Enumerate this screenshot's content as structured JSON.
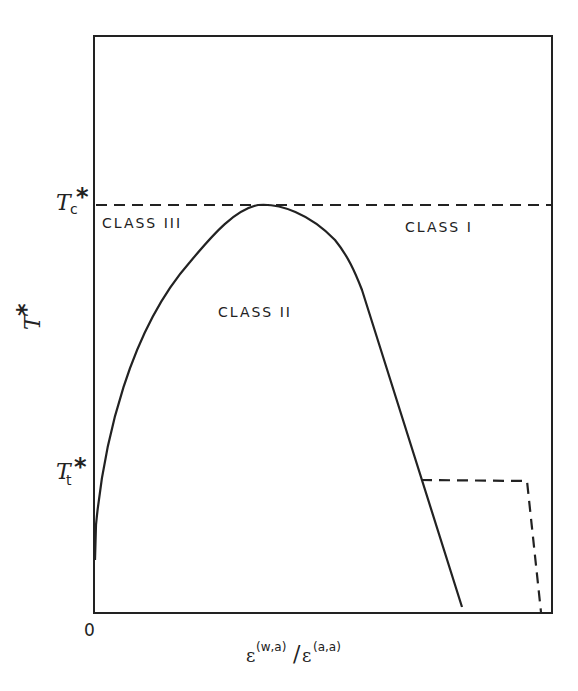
{
  "diagram": {
    "type": "phase-diagram",
    "axes": {
      "y_label_main": "T",
      "y_label_sup": "*",
      "x_label": {
        "num_symbol": "ε",
        "num_sup": "(w,a)",
        "slash": "/",
        "den_symbol": "ε",
        "den_sup": "(a,a)"
      },
      "origin_label": "0"
    },
    "y_ticks": [
      {
        "id": "tc",
        "main": "T",
        "sub": "c",
        "sup": "*"
      },
      {
        "id": "tt",
        "main": "T",
        "sub": "t",
        "sup": "*"
      }
    ],
    "regions": [
      {
        "id": "class-iii",
        "label": "CLASS III"
      },
      {
        "id": "class-ii",
        "label": "CLASS II"
      },
      {
        "id": "class-i",
        "label": "CLASS I"
      }
    ],
    "lines": [
      {
        "id": "critical-temperature-line",
        "style": "dashed",
        "description": "horizontal line at Tc*"
      },
      {
        "id": "coexistence-curve",
        "style": "solid",
        "description": "dome-shaped curve from axis to max at Tc* then falling"
      },
      {
        "id": "triple-point-line",
        "style": "dashed",
        "description": "horizontal at Tt* then down to axis"
      }
    ],
    "colors": {
      "ink": "#222222",
      "background": "#ffffff"
    }
  }
}
